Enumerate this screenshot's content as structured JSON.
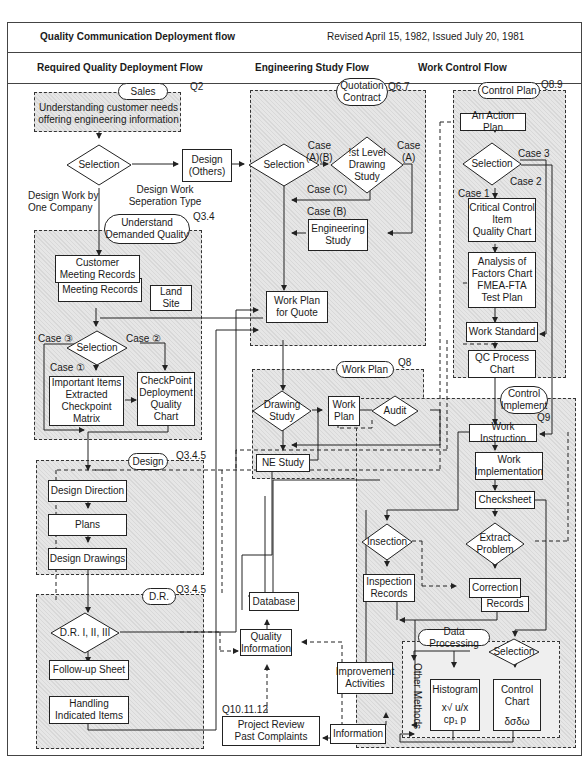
{
  "header": {
    "title": "Quality Communication Deployment flow",
    "revision": "Revised April 15, 1982, Issued July 20, 1981",
    "columns": [
      "Required Quality Deployment Flow",
      "Engineering Study Flow",
      "Work Control Flow"
    ]
  },
  "left": {
    "sales": {
      "label": "Sales",
      "ref": "Q2",
      "note": "Understanding customer needs\noffering engineering information"
    },
    "selection": "Selection",
    "design_others": "Design\n(Others)",
    "design_work_type": "Design Work\nSeperation Type",
    "one_company": "Design Work by\nOne Company",
    "understand": {
      "label": "Understand\nDemanded Quality",
      "ref": "Q3.4"
    },
    "customer_meeting": "Customer\nMeeting Records",
    "meeting_records": "Meeting Records",
    "land_site": "Land\nSite",
    "selection2": "Selection",
    "case3": "Case ③",
    "case2": "Case ②",
    "case1": "Case ①",
    "important_items": "Important Items\nExtracted\nCheckpoint\nMatrix",
    "checkpoint_chart": "CheckPoint\nDeployment\nQuality\nChart",
    "design": {
      "label": "Design",
      "ref": "Q3.4.5"
    },
    "design_direction": "Design Direction",
    "plans": "Plans",
    "design_drawings": "Design Drawings",
    "dr": {
      "label": "D.R.",
      "ref": "Q3.4.5"
    },
    "dr_levels": "D.R. I, II, III",
    "follow_up": "Follow-up Sheet",
    "handling": "Handling\nIndicated Items"
  },
  "middle": {
    "quotation": {
      "label": "Quotation\nContract",
      "ref": "Q6.7"
    },
    "selection": "Selection",
    "case_ab": "Case\n(A)(B)",
    "first_level": "!st Level\nDrawing\nStudy",
    "case_a": "Case\n(A)",
    "case_c": "Case (C)",
    "case_b": "Case (B)",
    "engineering_study": "Engineering\nStudy",
    "work_plan_quote": "Work Plan\nfor Quote",
    "work_plan_zone": {
      "label": "Work Plan",
      "ref": "Q8"
    },
    "drawing_study": "Drawing\nStudy",
    "work_plan": "Work\nPlan",
    "audit": "Audit",
    "ne_study": "NE Study",
    "database": "Database",
    "quality_info": "Quality\nInformation",
    "project_review_ref": "Q10.11.12",
    "project_review": "Project Review\nPast Complaints"
  },
  "right": {
    "control_plan": {
      "label": "Control Plan",
      "ref": "Q8.9"
    },
    "action_plan": "An Action Plan",
    "selection": "Selection",
    "case3": "Case 3",
    "case2": "Case 2",
    "case1": "Case 1",
    "critical": "Critical Control\nItem\nQuality Chart",
    "analysis": "Analysis of\nFactors Chart\nFMEA-FTA\nTest Plan",
    "work_standard": "Work Standard",
    "qc_process": "QC Process\nChart",
    "control_implement": {
      "label": "Control\nImplement",
      "ref": "Q9"
    },
    "work_instruction": "Work Instruction",
    "work_implementation": "Work\nImplementation",
    "checksheet": "Checksheet",
    "insection": "Insection",
    "extract_problem": "Extract\nProblem",
    "inspection_records": "Inspection\nRecords",
    "correction": "Correction",
    "records": "Records",
    "improvement": "Improvement\nActivities",
    "information": "Information",
    "data_processing": "Data Processing",
    "dp_selection": "Selection",
    "other_methods": "Other Methods",
    "histogram": "Histogram",
    "histogram_formula1": "x√ u/x",
    "histogram_formula2": "cp₁ p",
    "control_chart": "Control\nChart",
    "control_chart_formula": "δσδω"
  }
}
